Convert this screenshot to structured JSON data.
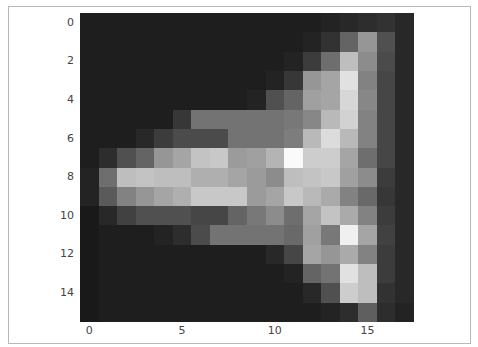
{
  "chart_data": {
    "type": "heatmap",
    "colormap": "gray",
    "title": "",
    "xlabel": "",
    "ylabel": "",
    "n_rows": 16,
    "n_cols": 18,
    "x_ticks": [
      "0",
      "5",
      "10",
      "15"
    ],
    "x_tick_positions": [
      0,
      5,
      10,
      15
    ],
    "y_ticks": [
      "0",
      "2",
      "4",
      "6",
      "8",
      "10",
      "12",
      "14"
    ],
    "y_tick_positions": [
      0,
      2,
      4,
      6,
      8,
      10,
      12,
      14
    ],
    "grid": false,
    "values": [
      [
        30,
        30,
        30,
        30,
        30,
        30,
        30,
        30,
        30,
        30,
        30,
        30,
        30,
        35,
        40,
        45,
        50,
        40
      ],
      [
        30,
        30,
        30,
        30,
        30,
        30,
        30,
        30,
        30,
        30,
        30,
        30,
        35,
        50,
        100,
        150,
        80,
        40
      ],
      [
        30,
        30,
        30,
        30,
        30,
        30,
        30,
        30,
        30,
        30,
        30,
        35,
        60,
        110,
        190,
        140,
        75,
        40
      ],
      [
        30,
        30,
        30,
        30,
        30,
        30,
        30,
        30,
        30,
        30,
        35,
        55,
        150,
        165,
        225,
        130,
        70,
        40
      ],
      [
        30,
        30,
        30,
        30,
        30,
        30,
        30,
        30,
        30,
        35,
        80,
        100,
        160,
        165,
        215,
        135,
        70,
        40
      ],
      [
        30,
        30,
        30,
        30,
        30,
        55,
        115,
        115,
        115,
        115,
        115,
        120,
        135,
        185,
        210,
        130,
        70,
        40
      ],
      [
        30,
        30,
        30,
        40,
        60,
        75,
        75,
        75,
        115,
        115,
        115,
        125,
        185,
        220,
        185,
        130,
        70,
        40
      ],
      [
        30,
        45,
        80,
        100,
        150,
        165,
        195,
        200,
        155,
        160,
        180,
        250,
        205,
        205,
        165,
        110,
        70,
        40
      ],
      [
        35,
        110,
        190,
        195,
        190,
        190,
        175,
        175,
        165,
        155,
        140,
        190,
        195,
        200,
        160,
        140,
        60,
        40
      ],
      [
        35,
        90,
        130,
        150,
        165,
        175,
        200,
        200,
        200,
        155,
        165,
        200,
        185,
        170,
        130,
        105,
        55,
        40
      ],
      [
        25,
        40,
        65,
        80,
        80,
        80,
        70,
        70,
        100,
        120,
        140,
        110,
        165,
        195,
        170,
        130,
        60,
        40
      ],
      [
        25,
        30,
        30,
        30,
        35,
        45,
        75,
        115,
        115,
        115,
        115,
        105,
        160,
        120,
        240,
        165,
        65,
        40
      ],
      [
        25,
        30,
        30,
        30,
        30,
        30,
        30,
        30,
        30,
        30,
        40,
        70,
        165,
        150,
        170,
        130,
        60,
        40
      ],
      [
        25,
        30,
        30,
        30,
        30,
        30,
        30,
        30,
        30,
        30,
        30,
        35,
        100,
        115,
        225,
        190,
        60,
        40
      ],
      [
        25,
        30,
        30,
        30,
        30,
        30,
        30,
        30,
        30,
        30,
        30,
        30,
        40,
        80,
        205,
        190,
        50,
        40
      ],
      [
        25,
        30,
        30,
        30,
        30,
        30,
        30,
        30,
        30,
        30,
        30,
        30,
        30,
        35,
        45,
        95,
        45,
        35
      ]
    ],
    "value_range": [
      0,
      255
    ]
  }
}
